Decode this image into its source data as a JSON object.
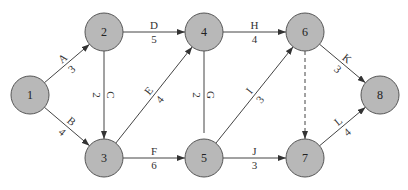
{
  "diagram": {
    "type": "activity-on-arrow network",
    "nodes": [
      {
        "id": "1",
        "label": "1",
        "x": 30,
        "y": 95
      },
      {
        "id": "2",
        "label": "2",
        "x": 104,
        "y": 32
      },
      {
        "id": "3",
        "label": "3",
        "x": 104,
        "y": 158
      },
      {
        "id": "4",
        "label": "4",
        "x": 204,
        "y": 32
      },
      {
        "id": "5",
        "label": "5",
        "x": 204,
        "y": 158
      },
      {
        "id": "6",
        "label": "6",
        "x": 305,
        "y": 32
      },
      {
        "id": "7",
        "label": "7",
        "x": 305,
        "y": 158
      },
      {
        "id": "8",
        "label": "8",
        "x": 380,
        "y": 95
      }
    ],
    "edges": [
      {
        "from": "1",
        "to": "2",
        "activity": "A",
        "duration": "3",
        "style": "solid",
        "arrow": true
      },
      {
        "from": "1",
        "to": "3",
        "activity": "B",
        "duration": "4",
        "style": "solid",
        "arrow": true
      },
      {
        "from": "2",
        "to": "3",
        "activity": "C",
        "duration": "2",
        "style": "solid",
        "arrow": true
      },
      {
        "from": "2",
        "to": "4",
        "activity": "D",
        "duration": "5",
        "style": "solid",
        "arrow": true
      },
      {
        "from": "3",
        "to": "4",
        "activity": "E",
        "duration": "4",
        "style": "solid",
        "arrow": true
      },
      {
        "from": "3",
        "to": "5",
        "activity": "F",
        "duration": "6",
        "style": "solid",
        "arrow": true
      },
      {
        "from": "4",
        "to": "5",
        "activity": "G",
        "duration": "2",
        "style": "solid",
        "arrow": false
      },
      {
        "from": "4",
        "to": "6",
        "activity": "H",
        "duration": "4",
        "style": "solid",
        "arrow": true
      },
      {
        "from": "5",
        "to": "6",
        "activity": "I",
        "duration": "3",
        "style": "solid",
        "arrow": true
      },
      {
        "from": "5",
        "to": "7",
        "activity": "J",
        "duration": "3",
        "style": "solid",
        "arrow": true
      },
      {
        "from": "6",
        "to": "8",
        "activity": "K",
        "duration": "3",
        "style": "solid",
        "arrow": true
      },
      {
        "from": "6",
        "to": "7",
        "activity": "",
        "duration": "",
        "style": "dashed",
        "arrow": true
      },
      {
        "from": "7",
        "to": "8",
        "activity": "L",
        "duration": "4",
        "style": "solid",
        "arrow": true
      }
    ],
    "colors": {
      "node_fill": "#b8b8b8",
      "node_stroke": "#555555",
      "edge": "#444444"
    }
  }
}
